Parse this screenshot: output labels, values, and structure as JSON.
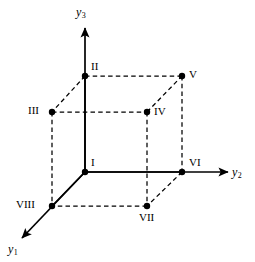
{
  "figure": {
    "background_color": "#ffffff",
    "line_color": "#000000",
    "point_color": "#000000",
    "width": 255,
    "height": 262
  },
  "axes": [
    {
      "id": "y1",
      "name": "y1-axis",
      "label_base": "y",
      "label_sub": "1",
      "direction": "down-left",
      "style": "solid",
      "arrow": true,
      "label_x": 8,
      "label_y": 243,
      "from": [
        85,
        172
      ],
      "to": [
        22,
        238
      ]
    },
    {
      "id": "y2",
      "name": "y2-axis",
      "label_base": "y",
      "label_sub": "2",
      "direction": "right",
      "style": "solid",
      "arrow": true,
      "label_x": 232,
      "label_y": 166,
      "from": [
        85,
        172
      ],
      "to": [
        228,
        172
      ]
    },
    {
      "id": "y3",
      "name": "y3-axis",
      "label_base": "y",
      "label_sub": "3",
      "direction": "up",
      "style": "solid",
      "arrow": true,
      "label_x": 76,
      "label_y": 6,
      "from": [
        85,
        172
      ],
      "to": [
        85,
        28
      ]
    }
  ],
  "vertices": [
    {
      "id": "I",
      "label": "I",
      "x": 85,
      "y": 172,
      "label_x": 91,
      "label_y": 157
    },
    {
      "id": "II",
      "label": "II",
      "x": 85,
      "y": 76,
      "label_x": 91,
      "label_y": 61
    },
    {
      "id": "III",
      "label": "III",
      "x": 52,
      "y": 112,
      "label_x": 28,
      "label_y": 105
    },
    {
      "id": "IV",
      "label": "IV",
      "x": 147,
      "y": 112,
      "label_x": 154,
      "label_y": 106
    },
    {
      "id": "V",
      "label": "V",
      "x": 182,
      "y": 76,
      "label_x": 189,
      "label_y": 69
    },
    {
      "id": "VI",
      "label": "VI",
      "x": 182,
      "y": 172,
      "label_x": 189,
      "label_y": 157
    },
    {
      "id": "VII",
      "label": "VII",
      "x": 147,
      "y": 206,
      "label_x": 139,
      "label_y": 212
    },
    {
      "id": "VIII",
      "label": "VIII",
      "x": 52,
      "y": 206,
      "label_x": 16,
      "label_y": 199
    }
  ],
  "edges": [
    {
      "id": "I-VI",
      "from": "I",
      "to": "VI",
      "style": "solid",
      "x1": 85,
      "y1": 172,
      "x2": 182,
      "y2": 172
    },
    {
      "id": "I-VIII",
      "from": "I",
      "to": "VIII",
      "style": "solid",
      "x1": 85,
      "y1": 172,
      "x2": 52,
      "y2": 206
    },
    {
      "id": "I-II",
      "from": "I",
      "to": "II",
      "style": "solid",
      "x1": 85,
      "y1": 172,
      "x2": 85,
      "y2": 76
    },
    {
      "id": "II-V",
      "from": "II",
      "to": "V",
      "style": "dashed",
      "x1": 85,
      "y1": 76,
      "x2": 182,
      "y2": 76
    },
    {
      "id": "II-III",
      "from": "II",
      "to": "III",
      "style": "dashed",
      "x1": 85,
      "y1": 76,
      "x2": 52,
      "y2": 112
    },
    {
      "id": "III-IV",
      "from": "III",
      "to": "IV",
      "style": "dashed",
      "x1": 52,
      "y1": 112,
      "x2": 147,
      "y2": 112
    },
    {
      "id": "III-VIII",
      "from": "III",
      "to": "VIII",
      "style": "dashed",
      "x1": 52,
      "y1": 112,
      "x2": 52,
      "y2": 206
    },
    {
      "id": "IV-V",
      "from": "IV",
      "to": "V",
      "style": "dashed",
      "x1": 147,
      "y1": 112,
      "x2": 182,
      "y2": 76
    },
    {
      "id": "IV-VII",
      "from": "IV",
      "to": "VII",
      "style": "dashed",
      "x1": 147,
      "y1": 112,
      "x2": 147,
      "y2": 206
    },
    {
      "id": "V-VI",
      "from": "V",
      "to": "VI",
      "style": "dashed",
      "x1": 182,
      "y1": 76,
      "x2": 182,
      "y2": 172
    },
    {
      "id": "VI-VII",
      "from": "VI",
      "to": "VII",
      "style": "dashed",
      "x1": 182,
      "y1": 172,
      "x2": 147,
      "y2": 206
    },
    {
      "id": "VII-VIII",
      "from": "VII",
      "to": "VIII",
      "style": "dashed",
      "x1": 147,
      "y1": 206,
      "x2": 52,
      "y2": 206
    }
  ]
}
